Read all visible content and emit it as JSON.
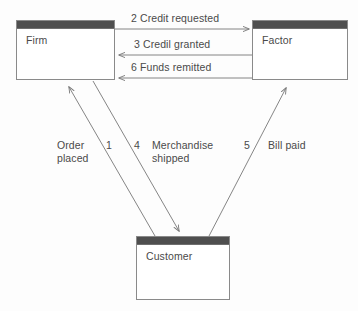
{
  "diagram": {
    "colors": {
      "box_border": "#8a8a8a",
      "titlebar": "#4f4f4f",
      "line": "#777777",
      "text": "#4a4a4a",
      "background": "#fdfdfd"
    },
    "nodes": [
      {
        "id": "firm",
        "label": "Firm",
        "x": 16,
        "y": 20,
        "w": 99,
        "h": 60
      },
      {
        "id": "factor",
        "label": "Factor",
        "x": 252,
        "y": 20,
        "w": 96,
        "h": 60
      },
      {
        "id": "customer",
        "label": "Customer",
        "x": 136,
        "y": 236,
        "w": 94,
        "h": 64
      }
    ],
    "edges": [
      {
        "id": "credit-requested",
        "step": "2",
        "text": "Credit requested",
        "label": "2 Credit requested",
        "from": "firm",
        "to": "factor",
        "direction": "right"
      },
      {
        "id": "credit-granted",
        "step": "3",
        "text": "Credil granted",
        "label": "3 Credil granted",
        "from": "factor",
        "to": "firm",
        "direction": "left"
      },
      {
        "id": "funds-remitted",
        "step": "6",
        "text": "Funds remitted",
        "label": "6 Funds remitted",
        "from": "factor",
        "to": "firm",
        "direction": "left"
      },
      {
        "id": "order-placed",
        "step": "1",
        "text": "Order placed",
        "label": "Order placed",
        "from": "customer",
        "to": "firm",
        "direction": "up-left"
      },
      {
        "id": "merchandise-shipped",
        "step": "4",
        "text": "Merchandise shipped",
        "label": "Merchandise shipped",
        "from": "firm",
        "to": "customer",
        "direction": "down-right"
      },
      {
        "id": "bill-paid",
        "step": "5",
        "text": "Bill paid",
        "label": "Bill paid",
        "from": "customer",
        "to": "factor",
        "direction": "up-right"
      }
    ],
    "annotations": {
      "order_placed_line1": "Order",
      "order_placed_line2": "placed",
      "step_1": "1",
      "step_4": "4",
      "merchandise_line1": "Merchandise",
      "merchandise_line2": "shipped",
      "step_5": "5",
      "bill_paid": "Bill paid",
      "credit_requested_full": "2 Credit requested",
      "credit_granted_full": "3 Credil granted",
      "funds_remitted_full": "6 Funds remitted"
    }
  }
}
